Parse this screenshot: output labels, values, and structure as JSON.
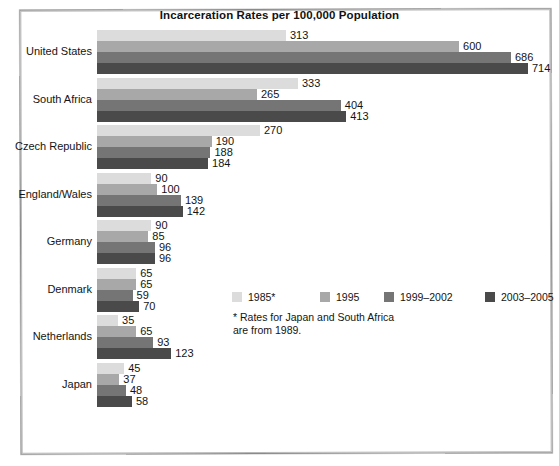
{
  "chart_data": {
    "type": "bar",
    "orientation": "horizontal",
    "title": "Incarceration Rates per 100,000 Population",
    "xlabel": "",
    "ylabel": "",
    "grid": false,
    "legend_position": "center-right",
    "xlim": [
      0,
      714
    ],
    "categories": [
      "United States",
      "South Africa",
      "Czech Republic",
      "England/Wales",
      "Germany",
      "Denmark",
      "Netherlands",
      "Japan"
    ],
    "series": [
      {
        "name": "1985*",
        "color": "#dcdcdc",
        "values": [
          313,
          333,
          270,
          90,
          90,
          65,
          35,
          45
        ]
      },
      {
        "name": "1995",
        "color": "#a8a8a8",
        "values": [
          600,
          265,
          190,
          100,
          85,
          65,
          65,
          37
        ]
      },
      {
        "name": "1999–2002",
        "color": "#757575",
        "values": [
          686,
          404,
          188,
          139,
          96,
          59,
          93,
          48
        ]
      },
      {
        "name": "2003–2005",
        "color": "#4a4a4a",
        "values": [
          714,
          413,
          184,
          142,
          96,
          70,
          123,
          58
        ]
      }
    ],
    "annotations": [
      "* Rates for Japan and South Africa",
      "are from 1989."
    ]
  },
  "footnote": {
    "line1": "* Rates for Japan and South Africa",
    "line2": "are from 1989."
  }
}
